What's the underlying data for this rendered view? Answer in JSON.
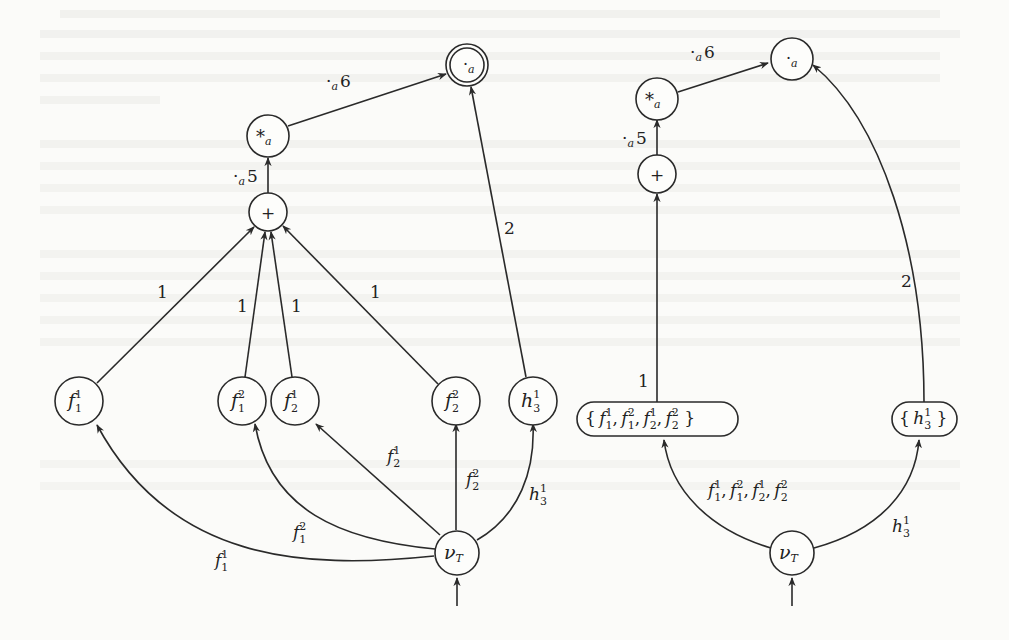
{
  "left_graph": {
    "nodes": {
      "output": {
        "symbol": "·",
        "sub": "a",
        "final": true
      },
      "star": {
        "symbol": "*",
        "sub": "a"
      },
      "plus": {
        "symbol": "+"
      },
      "f11": {
        "base": "f",
        "sup": "1",
        "sub": "1"
      },
      "f12": {
        "base": "f",
        "sup": "2",
        "sub": "1"
      },
      "f21": {
        "base": "f",
        "sup": "1",
        "sub": "2"
      },
      "f22": {
        "base": "f",
        "sup": "2",
        "sub": "2"
      },
      "h31": {
        "base": "h",
        "sup": "1",
        "sub": "3"
      },
      "nu": {
        "base": "ν",
        "sub": "T"
      }
    },
    "edge_labels": {
      "star_to_output": {
        "op": "·",
        "sub": "a",
        "val": "6"
      },
      "plus_to_star": {
        "op": "·",
        "sub": "a",
        "val": "5"
      },
      "f11_to_plus": "1",
      "f12_to_plus": "1",
      "f21_to_plus": "1",
      "f22_to_plus": "1",
      "h31_to_output": "2",
      "nu_to_f11": {
        "base": "f",
        "sup": "1",
        "sub": "1"
      },
      "nu_to_f12": {
        "base": "f",
        "sup": "2",
        "sub": "1"
      },
      "nu_to_f21": {
        "base": "f",
        "sup": "1",
        "sub": "2"
      },
      "nu_to_f22": {
        "base": "f",
        "sup": "2",
        "sub": "2"
      },
      "nu_to_h31": {
        "base": "h",
        "sup": "1",
        "sub": "3"
      }
    }
  },
  "right_graph": {
    "nodes": {
      "output": {
        "symbol": "·",
        "sub": "a"
      },
      "star": {
        "symbol": "*",
        "sub": "a"
      },
      "plus": {
        "symbol": "+"
      },
      "fset": {
        "open": "{",
        "close": "}",
        "items": [
          {
            "base": "f",
            "sup": "1",
            "sub": "1"
          },
          {
            "base": "f",
            "sup": "2",
            "sub": "1"
          },
          {
            "base": "f",
            "sup": "1",
            "sub": "2"
          },
          {
            "base": "f",
            "sup": "2",
            "sub": "2"
          }
        ]
      },
      "hset": {
        "open": "{",
        "close": "}",
        "items": [
          {
            "base": "h",
            "sup": "1",
            "sub": "3"
          }
        ]
      },
      "nu": {
        "base": "ν",
        "sub": "T"
      }
    },
    "edge_labels": {
      "star_to_output": {
        "op": "·",
        "sub": "a",
        "val": "6"
      },
      "plus_to_star": {
        "op": "·",
        "sub": "a",
        "val": "5"
      },
      "fset_to_plus": "1",
      "hset_to_output": "2",
      "nu_to_fset": {
        "text": "f¹₁, f²₁, f¹₂, f²₂",
        "items": [
          {
            "base": "f",
            "sup": "1",
            "sub": "1"
          },
          {
            "base": "f",
            "sup": "2",
            "sub": "1"
          },
          {
            "base": "f",
            "sup": "1",
            "sub": "2"
          },
          {
            "base": "f",
            "sup": "2",
            "sub": "2"
          }
        ]
      },
      "nu_to_hset": {
        "base": "h",
        "sup": "1",
        "sub": "3"
      }
    }
  },
  "separator": ","
}
